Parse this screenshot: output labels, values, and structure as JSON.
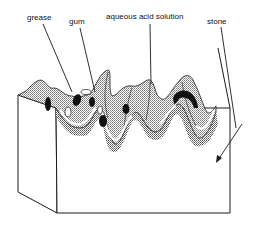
{
  "diagram": {
    "labels": {
      "grease": "grease",
      "gum": "gum",
      "aqueous": "aqueous acid solution",
      "stone": "stone"
    },
    "colors": {
      "line": "#1a1a1a",
      "solution_fill": "#c8c8c8",
      "shadow_fill": "#b0b0b0",
      "grease_fill": "#111111",
      "gum_fill": "#ffffff",
      "stone_fill": "#ffffff"
    }
  }
}
